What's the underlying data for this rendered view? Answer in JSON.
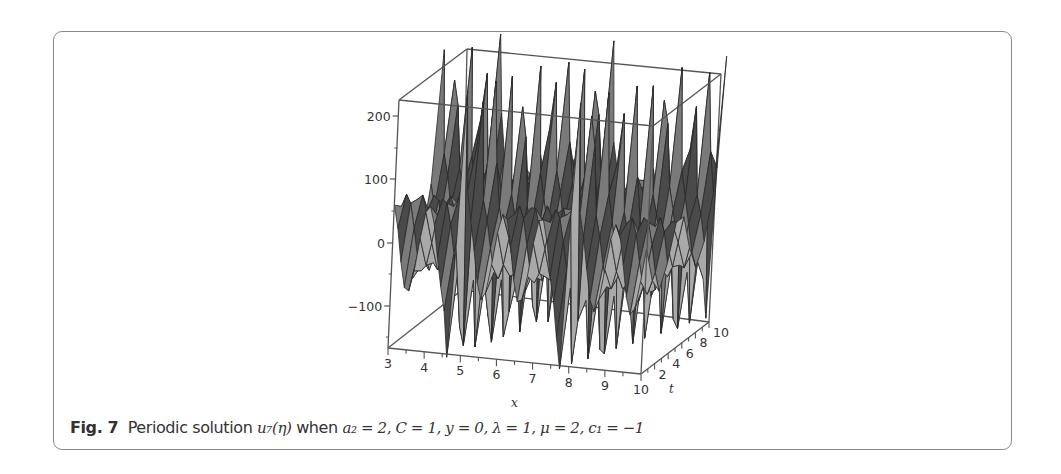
{
  "figure": {
    "label": "Fig. 7",
    "caption_text": "Periodic solution",
    "caption_math": "u₇(η) when a₂ = 2, C = 1, y = 0, λ = 1, μ = 2, c₁ = −1",
    "caption_func": "u₇(η)",
    "caption_when": "when",
    "caption_params": "a₂ = 2, C = 1, y = 0, λ = 1, μ = 2, c₁ = −1"
  },
  "colors": {
    "frame_border": "#8a8a8a",
    "surface_fill": "#7a7a7a",
    "surface_light": "#a9a9a9",
    "surface_dark": "#4a4a4a",
    "edge": "#2a2a2a",
    "box_line": "#555555"
  },
  "chart_data": {
    "type": "surface3d",
    "xlabel": "x",
    "ylabel": "t",
    "zlabel": "",
    "x_range": [
      3,
      10
    ],
    "t_range": [
      0,
      10
    ],
    "z_range": [
      -160,
      260
    ],
    "x_ticks": [
      "3",
      "4",
      "5",
      "6",
      "7",
      "8",
      "9",
      "10"
    ],
    "t_ticks": [
      "2",
      "4",
      "6",
      "8",
      "10"
    ],
    "z_ticks": [
      "200",
      "100",
      "0",
      "-100"
    ],
    "features": {
      "large_positive_peaks": [
        {
          "x": 5.0,
          "z": 260
        },
        {
          "x": 8.1,
          "z": 230
        }
      ],
      "large_negative_troughs": [
        {
          "x": 4.6,
          "z": -170
        },
        {
          "x": 7.8,
          "z": -160
        },
        {
          "x": 10.0,
          "z": -130
        }
      ],
      "secondary_peaks_approx": 70,
      "secondary_troughs_approx": -60,
      "period_in_x_approx": 3.1
    },
    "grid": false
  }
}
